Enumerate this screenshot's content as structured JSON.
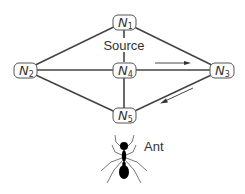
{
  "diagram": {
    "type": "graph",
    "nodes": [
      {
        "id": "N1",
        "label": "N",
        "sub": "1",
        "x": 124,
        "y": 22
      },
      {
        "id": "N2",
        "label": "N",
        "sub": "2",
        "x": 25,
        "y": 70
      },
      {
        "id": "N3",
        "label": "N",
        "sub": "3",
        "x": 222,
        "y": 70
      },
      {
        "id": "N4",
        "label": "N",
        "sub": "4",
        "x": 124,
        "y": 70
      },
      {
        "id": "N5",
        "label": "N",
        "sub": "5",
        "x": 124,
        "y": 116
      }
    ],
    "edges": [
      [
        "N1",
        "N2"
      ],
      [
        "N1",
        "N3"
      ],
      [
        "N1",
        "N4"
      ],
      [
        "N2",
        "N4"
      ],
      [
        "N4",
        "N3"
      ],
      [
        "N2",
        "N5"
      ],
      [
        "N4",
        "N5"
      ],
      [
        "N5",
        "N3"
      ]
    ],
    "annotations": {
      "source_label": "Source",
      "ant_label": "Ant"
    },
    "arrows": [
      {
        "name": "direction-arrow-n4-to-n3",
        "from": [
          155,
          63
        ],
        "to": [
          190,
          63
        ]
      },
      {
        "name": "direction-arrow-n3-to-n5",
        "from": [
          193,
          88
        ],
        "to": [
          161,
          103
        ]
      }
    ]
  }
}
